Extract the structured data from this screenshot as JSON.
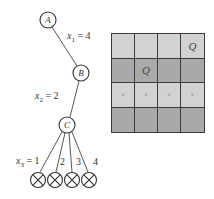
{
  "tree": {
    "nodes": [
      {
        "id": "A",
        "label": "A"
      },
      {
        "id": "B",
        "label": "B"
      },
      {
        "id": "C",
        "label": "C"
      }
    ],
    "edge_labels": {
      "x1": {
        "var": "x",
        "sub": "1",
        "text": " = 4"
      },
      "x2": {
        "var": "x",
        "sub": "2",
        "text": " = 2"
      },
      "x3": {
        "var": "x",
        "sub": "3",
        "text": " = 1"
      }
    },
    "leaf_labels": [
      "2",
      "3",
      "4"
    ],
    "leaf_symbol": "⊗",
    "leaf_count": 4
  },
  "board": {
    "rows": 4,
    "cols": 4,
    "row_shading": [
      "light",
      "dark",
      "light",
      "dark"
    ],
    "cells": [
      [
        "",
        "",
        "",
        "Q"
      ],
      [
        "",
        "Q",
        "",
        ""
      ],
      [
        "×",
        "×",
        "×",
        "×"
      ],
      [
        "",
        "",
        "",
        ""
      ]
    ],
    "colors": {
      "light": "#d2d2d2",
      "dark": "#a9a9a9",
      "grid": "#3a3a3a"
    }
  }
}
